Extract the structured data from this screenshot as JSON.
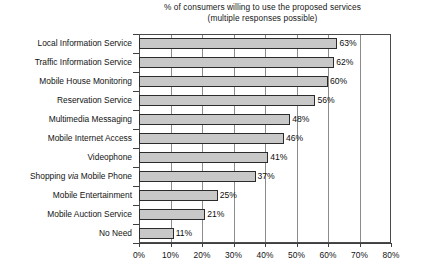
{
  "chart_data": {
    "type": "bar",
    "orientation": "horizontal",
    "title": "% of consumers willing to use the proposed services",
    "subtitle": "(multiple responses possible)",
    "xlabel": "",
    "ylabel": "",
    "xlim": [
      0,
      80
    ],
    "grid": "vertical",
    "legend": "none",
    "categories": [
      "Local Information Service",
      "Traffic Information Service",
      "Mobile House Monitoring",
      "Reservation Service",
      "Multimedia Messaging",
      "Mobile Internet Access",
      "Videophone",
      "Shopping via Mobile Phone",
      "Mobile Entertainment",
      "Mobile Auction Service",
      "No Need"
    ],
    "values": [
      63,
      62,
      60,
      56,
      48,
      46,
      41,
      37,
      25,
      21,
      11
    ],
    "value_labels": [
      "63%",
      "62%",
      "60%",
      "56%",
      "48%",
      "46%",
      "41%",
      "37%",
      "25%",
      "21%",
      "11%"
    ],
    "xticks": [
      0,
      10,
      20,
      30,
      40,
      50,
      60,
      70,
      80
    ],
    "xtick_labels": [
      "0%",
      "10%",
      "20%",
      "30%",
      "40%",
      "50%",
      "60%",
      "70%",
      "80%"
    ],
    "colors": {
      "bar_fill": "#c8c8c8",
      "bar_edge": "#2b2b2b",
      "gridline": "#8c8c8c",
      "frame": "#4a4a4a",
      "text": "#131313",
      "background": "#ffffff"
    },
    "category_emphasis": [
      {
        "index": 7,
        "italic_word": "via"
      }
    ]
  }
}
